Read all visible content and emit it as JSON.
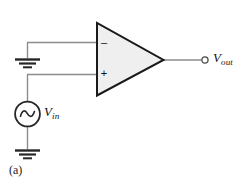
{
  "figure": {
    "panel_label": "(a)",
    "background_color": "#ffffff",
    "wire_color": "#808080",
    "outline_color": "#1a1a1a",
    "amp_fill_color": "#f0f0f0"
  },
  "opamp": {
    "name": "operational-amplifier",
    "inverting_input_label": "–",
    "noninverting_input_label": "+"
  },
  "source": {
    "type": "ac-voltage-source",
    "label_symbol": "V",
    "label_subscript": "in"
  },
  "output": {
    "terminal": "open-circle",
    "label_symbol": "V",
    "label_subscript": "out"
  },
  "grounds": [
    {
      "name": "ground-inverting-input"
    },
    {
      "name": "ground-source-return"
    }
  ]
}
